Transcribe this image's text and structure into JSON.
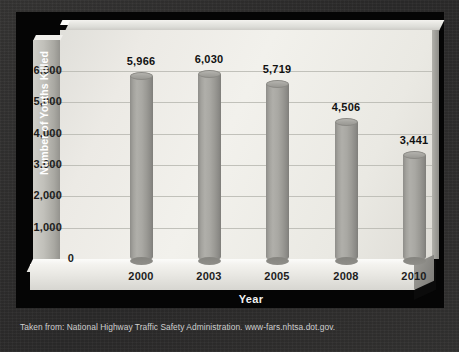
{
  "caption": "Taken from: National Highway Traffic Safety Administration. www-fars.nhtsa.dot.gov.",
  "colors": {
    "background": "#302f2f",
    "panel": "#050505",
    "plot_wall": "#f2f1ec",
    "bar_fill": "#a3a29d",
    "axis_wall": "#c1c0ba",
    "text_dark": "#1c1c1c",
    "text_light": "#ffffff"
  },
  "chart_data": {
    "type": "bar",
    "title": "",
    "subtitle": "",
    "xlabel": "Year",
    "ylabel": "Number of Youths Killed",
    "categories": [
      "2000",
      "2003",
      "2005",
      "2008",
      "2010"
    ],
    "values": [
      5966,
      6030,
      5719,
      4506,
      3441
    ],
    "data_labels": [
      "5,966",
      "6,030",
      "5,719",
      "4,506",
      "3,441"
    ],
    "ylim": [
      0,
      6500
    ],
    "yticks": [
      0,
      1000,
      2000,
      3000,
      4000,
      5000,
      6000
    ],
    "ytick_labels": [
      "0",
      "1,000",
      "2,000",
      "3,000",
      "4,000",
      "5,000",
      "6,000"
    ],
    "grid": true,
    "legend": false,
    "legend_position": "none",
    "style": "3d-cylinder"
  }
}
